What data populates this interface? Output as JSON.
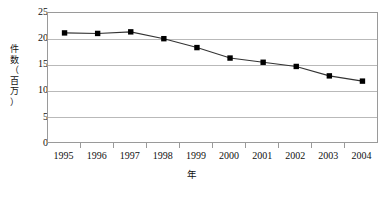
{
  "chart_data": {
    "type": "line",
    "title": "",
    "subtitle": "",
    "xlabel": "年",
    "ylabel": "件数（百万）",
    "ylabel_chars": [
      "件",
      "数",
      "（",
      "百",
      "万",
      "）"
    ],
    "categories": [
      "1995",
      "1996",
      "1997",
      "1998",
      "1999",
      "2000",
      "2001",
      "2002",
      "2003",
      "2004"
    ],
    "values": [
      21.2,
      21.1,
      21.4,
      20.1,
      18.4,
      16.4,
      15.6,
      14.8,
      13.0,
      12.0
    ],
    "series": [
      {
        "name": "件数（百万）",
        "values": [
          21.2,
          21.1,
          21.4,
          20.1,
          18.4,
          16.4,
          15.6,
          14.8,
          13.0,
          12.0
        ],
        "marker": "square",
        "marker_color": "#000000",
        "line_color": "#333333"
      }
    ],
    "ylim": [
      0,
      25
    ],
    "yticks": [
      0,
      5,
      10,
      15,
      20,
      25
    ],
    "ytick_labels": [
      "0",
      "5",
      "10",
      "15",
      "20",
      "25"
    ],
    "xlim_categories": true,
    "grid": true,
    "grid_axis": "y",
    "grid_color": "#b9b9b9",
    "legend": false,
    "legend_position": "none",
    "frame_color": "#9a9a9a",
    "background": "#ffffff"
  }
}
